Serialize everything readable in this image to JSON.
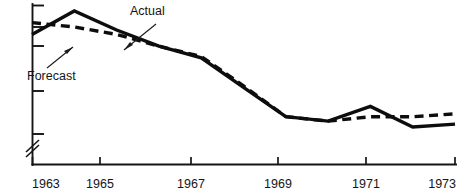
{
  "chart_data": {
    "type": "line",
    "title": "",
    "subtitle": "",
    "xlabel": "",
    "ylabel": "",
    "xlim": [
      1963,
      1973
    ],
    "ylim": [
      0,
      100
    ],
    "grid": false,
    "legend_position": "inline-annotations",
    "y_axis_broken": true,
    "y_tick_labels": [],
    "x_tick_labels": [
      "1963",
      "1965",
      "1967",
      "1969",
      "1971",
      "1973"
    ],
    "x_ticks": [
      1963,
      1965,
      1967,
      1969,
      1971,
      1973
    ],
    "x": [
      1963,
      1964,
      1965,
      1966,
      1967,
      1968,
      1969,
      1970,
      1971,
      1972,
      1973
    ],
    "series": [
      {
        "name": "Actual",
        "style": "solid",
        "values": [
          80,
          96,
          83,
          72,
          64,
          44,
          24,
          21,
          31,
          17,
          19
        ]
      },
      {
        "name": "Forecast",
        "style": "dashed",
        "values": [
          88,
          85,
          80,
          72,
          65,
          45,
          24,
          21,
          24,
          24,
          26
        ]
      }
    ],
    "annotations": [
      {
        "label": "Actual",
        "target_series": "Actual",
        "target_x": 1965.6
      },
      {
        "label": "Forecast",
        "target_series": "Forecast",
        "target_x": 1964.8
      }
    ]
  },
  "labels": {
    "actual": "Actual",
    "forecast": "Forecast",
    "x1963": "1963",
    "x1965": "1965",
    "x1967": "1967",
    "x1969": "1969",
    "x1971": "1971",
    "x1973": "1973"
  },
  "colors": {
    "ink": "#0d0d0d",
    "background": "#ffffff"
  }
}
